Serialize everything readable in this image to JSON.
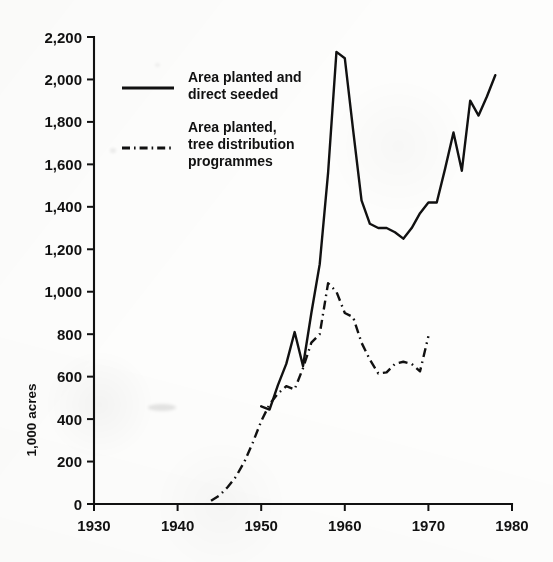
{
  "figure": {
    "background_color": "#fdfdfc",
    "ink_color": "#111111"
  },
  "axes": {
    "y_title": "1,000 acres",
    "y_ticks": [
      "0",
      "200",
      "400",
      "600",
      "800",
      "1,000",
      "1,200",
      "1,400",
      "1,600",
      "1,800",
      "2,000",
      "2,200"
    ],
    "x_ticks": [
      "1930",
      "1940",
      "1950",
      "1960",
      "1970",
      "1980"
    ]
  },
  "legend": {
    "entries": [
      {
        "id": "area-planted-and-direct-seeded",
        "style": "solid",
        "line1": "Area planted and",
        "line2": "direct seeded"
      },
      {
        "id": "area-planted-tree-distribution-programmes",
        "style": "dash-dot",
        "line1": "Area planted,",
        "line2": "tree distribution",
        "line3": "programmes"
      }
    ]
  },
  "chart_data": {
    "type": "line",
    "title": "",
    "subtitle": "",
    "xlabel": "",
    "ylabel": "1,000 acres",
    "xlim": [
      1930,
      1980
    ],
    "ylim": [
      0,
      2200
    ],
    "x_tick_values": [
      1930,
      1940,
      1950,
      1960,
      1970,
      1980
    ],
    "y_tick_values": [
      0,
      200,
      400,
      600,
      800,
      1000,
      1200,
      1400,
      1600,
      1800,
      2000,
      2200
    ],
    "grid": false,
    "legend_position": "upper-left-inside",
    "units": "1,000 acres",
    "series": [
      {
        "name": "Area planted and direct seeded",
        "style": "solid",
        "color": "#111111",
        "x": [
          1950,
          1951,
          1952,
          1953,
          1954,
          1955,
          1956,
          1957,
          1958,
          1959,
          1960,
          1961,
          1962,
          1963,
          1964,
          1965,
          1966,
          1967,
          1968,
          1969,
          1970,
          1971,
          1972,
          1973,
          1974,
          1975,
          1976,
          1977,
          1978
        ],
        "values": [
          460,
          445,
          560,
          660,
          810,
          650,
          900,
          1130,
          1560,
          2130,
          2100,
          1760,
          1430,
          1320,
          1300,
          1300,
          1280,
          1250,
          1300,
          1370,
          1420,
          1420,
          1580,
          1750,
          1570,
          1900,
          1830,
          1920,
          2020
        ]
      },
      {
        "name": "Area planted, tree distribution programmes",
        "style": "dash-dot",
        "color": "#111111",
        "x": [
          1944,
          1945,
          1946,
          1947,
          1948,
          1949,
          1950,
          1951,
          1952,
          1953,
          1954,
          1955,
          1956,
          1957,
          1958,
          1959,
          1960,
          1961,
          1962,
          1963,
          1964,
          1965,
          1966,
          1967,
          1968,
          1969,
          1970
        ],
        "values": [
          15,
          40,
          80,
          130,
          200,
          290,
          390,
          470,
          520,
          555,
          540,
          640,
          760,
          800,
          1040,
          1000,
          900,
          880,
          760,
          680,
          615,
          620,
          660,
          670,
          660,
          625,
          790
        ]
      }
    ]
  }
}
